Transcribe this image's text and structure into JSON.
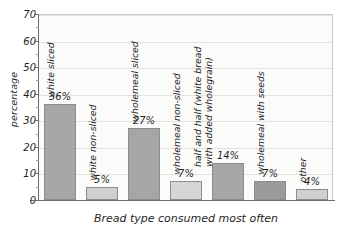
{
  "chart_data": {
    "type": "bar",
    "title": "",
    "xlabel": "Bread type consumed most often",
    "ylabel": "percentage",
    "ylim": [
      0,
      70
    ],
    "ytick_step": 10,
    "yticks": [
      "0",
      "10",
      "20",
      "30",
      "40",
      "50",
      "60",
      "70"
    ],
    "grid": true,
    "legend": "none",
    "categories": [
      "white sliced",
      "white non-sliced",
      "wholemeal sliced",
      "wholemeal non-sliced",
      "half and half (white bread\nwith added wholegrain)",
      "wholemeal with seeds",
      "other"
    ],
    "values": [
      36,
      5,
      27,
      7,
      14,
      7,
      4
    ],
    "value_labels": [
      "36%",
      "5%",
      "27%",
      "7%",
      "14%",
      "7%",
      "4%"
    ],
    "bar_colors": [
      "#a6a6a6",
      "#cfcfcf",
      "#a6a6a6",
      "#d6d6d6",
      "#a6a6a6",
      "#9b9b9b",
      "#cfcfcf"
    ],
    "bar_border_color": "#8c8c8c",
    "axis_color": "#6d6d6d",
    "gridline_color": "#e2e2de",
    "plot_background": "#fbfbfa"
  }
}
